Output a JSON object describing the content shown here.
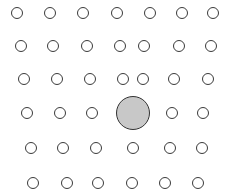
{
  "figure": {
    "colors": {
      "background": "#ffffff",
      "small_stroke": "#3a3a3a",
      "small_fill": "#ffffff",
      "large_fill": "#c8c8c8",
      "large_stroke": "#333333"
    },
    "small_radius": 6,
    "large_circle": {
      "cx": 133,
      "cy": 113,
      "r": 17
    },
    "rows": [
      {
        "cy": 13,
        "xs": [
          17,
          50,
          83,
          117,
          150,
          182,
          213
        ]
      },
      {
        "cy": 46,
        "xs": [
          21,
          53,
          87,
          120,
          144,
          179,
          211
        ]
      },
      {
        "cy": 79,
        "xs": [
          24,
          57,
          90,
          123,
          143,
          174,
          208
        ]
      },
      {
        "cy": 113,
        "xs": [
          27,
          60,
          92,
          172,
          203
        ]
      },
      {
        "cy": 148,
        "xs": [
          31,
          63,
          96,
          133,
          170,
          202
        ]
      },
      {
        "cy": 183,
        "xs": [
          33,
          67,
          98,
          132,
          165,
          198
        ]
      }
    ]
  }
}
